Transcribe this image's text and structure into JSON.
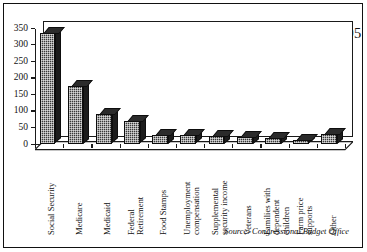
{
  "chart_data": {
    "type": "bar",
    "title": "Federal Government Entitlement Spending, 1995",
    "subtitle": "(billions of dollars)",
    "xlabel": "",
    "ylabel": "",
    "ylim": [
      0,
      350
    ],
    "yticks": [
      0,
      50,
      100,
      150,
      200,
      250,
      300,
      350
    ],
    "grid": false,
    "legend": null,
    "source": "Source: Congressional Budget Office",
    "categories": [
      "Social Security",
      "Medicare",
      "Medicaid",
      "Federal Retirement",
      "Food Stamps",
      "Unemployment compensation",
      "Supplemental security income",
      "Veterans",
      "Families with dependent children",
      "Farm price supports",
      "Other"
    ],
    "category_lines": [
      [
        "Social Security"
      ],
      [
        "Medicare"
      ],
      [
        "Medicaid"
      ],
      [
        "Federal",
        "Retirement"
      ],
      [
        "Food Stamps"
      ],
      [
        "Unemployment",
        "compensation"
      ],
      [
        "Supplemental",
        "security income"
      ],
      [
        "Veterans"
      ],
      [
        "Families with",
        "dependent",
        "children"
      ],
      [
        "Farm price",
        "supports"
      ],
      [
        "Other"
      ]
    ],
    "values": [
      333,
      175,
      89,
      67,
      27,
      25,
      24,
      21,
      17,
      10,
      29
    ]
  },
  "style": {
    "bar_face": "#3a3a3a",
    "bar_top": "#2b2b2b",
    "bar_side": "#1c1c1c",
    "axis_color": "#1a1a1a",
    "background": "#ffffff",
    "text_color": "#111111"
  }
}
